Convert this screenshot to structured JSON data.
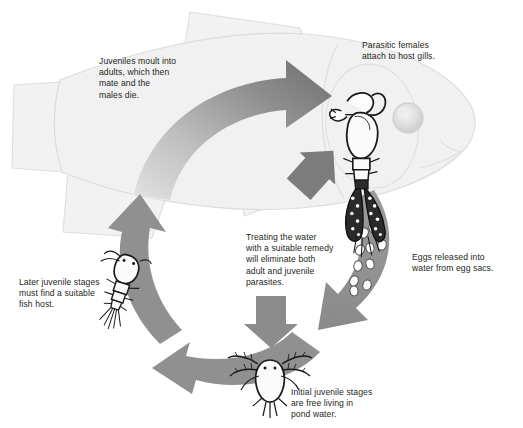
{
  "diagram": {
    "background_color": "#ffffff",
    "fish": {
      "name": "host-fish",
      "fill": "#f1f1f1",
      "outline": "#d8d8d8",
      "facing": "right"
    },
    "palette": {
      "arrow_gray": "#8f8f8f",
      "arrow_dark": "#6e6e6e",
      "arrow_light": "#d9d9d9",
      "text": "#231f20",
      "egg_fill": "#ffffff",
      "parasite_line": "#1a1a1a"
    },
    "captions": [
      {
        "id": "moult",
        "text": "Juveniles moult into\nadults, which then\nmate and the\nmales die."
      },
      {
        "id": "gills",
        "text": "Parasitic females\nattach to host gills."
      },
      {
        "id": "treat",
        "text": "Treating the water\nwith a suitable remedy\nwill eliminate both\nadult and juvenile\nparasites."
      },
      {
        "id": "eggs",
        "text": "Eggs released into\nwater from egg sacs."
      },
      {
        "id": "later",
        "text": "Later juvenile stages\nmust find a suitable\nfish host."
      },
      {
        "id": "initial",
        "text": "Initial juvenile stages\nare free living in\npond water."
      }
    ],
    "stages": [
      {
        "id": "adult-parasite",
        "label": "adult parasitic female on gills"
      },
      {
        "id": "egg-sac",
        "label": "eggs released into water"
      },
      {
        "id": "nauplius",
        "label": "free-living initial juvenile"
      },
      {
        "id": "copepodid",
        "label": "later juvenile seeking fish host"
      }
    ],
    "arrows": [
      {
        "id": "arrow-to-gills-main",
        "direction": "clockwise-top",
        "note": "juvenile to adult on host"
      },
      {
        "id": "arrow-treatment-up",
        "direction": "up-right",
        "note": "treatment reaching adult parasites"
      },
      {
        "id": "arrow-eggs-down",
        "direction": "down-left",
        "note": "eggs released to water"
      },
      {
        "id": "arrow-treatment-down",
        "direction": "down",
        "note": "treatment reaching juveniles"
      },
      {
        "id": "arrow-hatch-left",
        "direction": "left",
        "note": "juveniles spread in pond"
      },
      {
        "id": "arrow-host-up",
        "direction": "up",
        "note": "juveniles find fish host"
      }
    ]
  }
}
